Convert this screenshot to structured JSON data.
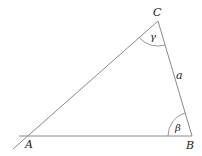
{
  "diagram": {
    "type": "triangle",
    "vertices": {
      "A": {
        "label": "A",
        "x": 30,
        "y": 136
      },
      "B": {
        "label": "B",
        "x": 192,
        "y": 136
      },
      "C": {
        "label": "C",
        "x": 158,
        "y": 21
      }
    },
    "sides": {
      "a": {
        "label": "a",
        "between": [
          "B",
          "C"
        ]
      }
    },
    "angles": {
      "gamma": {
        "label": "γ",
        "vertex": "C"
      },
      "beta": {
        "label": "β",
        "vertex": "B"
      }
    },
    "colors": {
      "line": "#8a8a8a",
      "text": "#222222",
      "background": "#ffffff"
    }
  }
}
